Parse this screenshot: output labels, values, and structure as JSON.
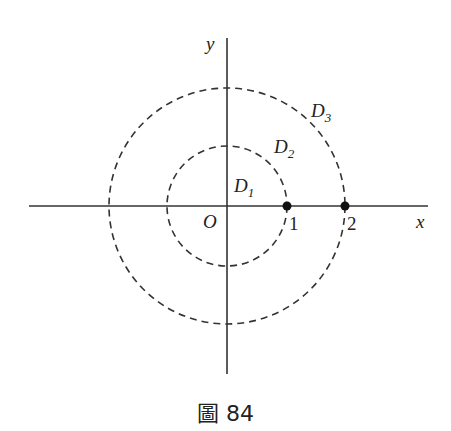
{
  "figure": {
    "caption": "圖 84",
    "axes": {
      "x_label": "x",
      "y_label": "y",
      "origin_label": "O"
    },
    "regions": [
      {
        "name": "D",
        "subscript": "1"
      },
      {
        "name": "D",
        "subscript": "2"
      },
      {
        "name": "D",
        "subscript": "3"
      }
    ],
    "tick_labels": [
      "1",
      "2"
    ],
    "circles": [
      {
        "radius": 1,
        "style": "dashed"
      },
      {
        "radius": 2,
        "style": "dashed"
      }
    ],
    "points": [
      {
        "x": 1,
        "y": 0
      },
      {
        "x": 2,
        "y": 0
      }
    ],
    "colors": {
      "stroke": "#333333",
      "background": "#ffffff"
    }
  }
}
